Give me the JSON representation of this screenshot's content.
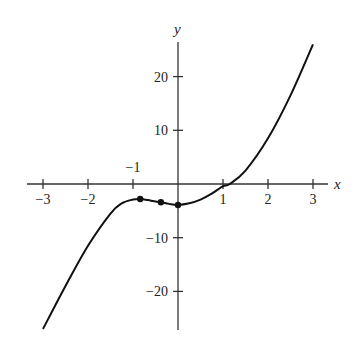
{
  "chart_data": {
    "type": "line",
    "title": "",
    "xlabel": "x",
    "ylabel": "y",
    "xlim": [
      -3.3,
      3.5
    ],
    "ylim": [
      -28,
      30
    ],
    "grid": false,
    "legend": null,
    "x_ticks": [
      -3,
      -2,
      -1,
      1,
      2,
      3
    ],
    "x_tick_labels": [
      "−3",
      "−2",
      "−1",
      "1",
      "2",
      "3"
    ],
    "x_tick_label_above": [
      "−1"
    ],
    "y_ticks": [
      20,
      10,
      -10,
      -20
    ],
    "y_tick_labels": [
      "20",
      "10",
      "−10",
      "−20"
    ],
    "series": [
      {
        "name": "curve",
        "x": [
          -3,
          -2.5,
          -2,
          -1.5,
          -1.25,
          -1,
          -0.84,
          -0.6,
          -0.38,
          -0.2,
          0,
          0.25,
          0.5,
          0.75,
          1,
          1.15,
          1.5,
          2,
          2.5,
          3
        ],
        "y": [
          -27,
          -19,
          -11.5,
          -5.5,
          -3.6,
          -2.9,
          -2.8,
          -3.1,
          -3.4,
          -3.7,
          -3.9,
          -3.6,
          -2.9,
          -1.8,
          -0.4,
          0,
          2.5,
          8.5,
          16.5,
          26
        ]
      }
    ],
    "marked_points": [
      {
        "x": -0.84,
        "y": -2.8
      },
      {
        "x": -0.38,
        "y": -3.4
      },
      {
        "x": 0,
        "y": -3.9
      }
    ]
  }
}
